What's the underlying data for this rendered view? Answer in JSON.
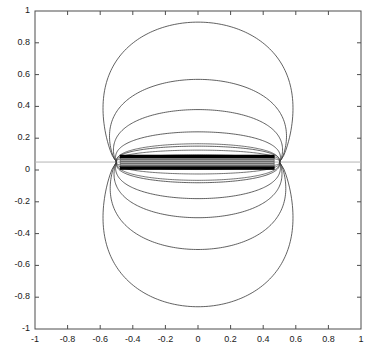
{
  "figure": {
    "title": "",
    "background_color": "#ffffff",
    "frame_color": "#4d4d4d",
    "contour_color": "#3a3a3a",
    "bar_color": "#000000",
    "band_color": "#6e6e6e",
    "guide_line_color": "#b4b4b4"
  },
  "axes": {
    "xlim": [
      -1,
      1
    ],
    "ylim": [
      -1,
      1
    ],
    "grid": false,
    "tick_direction": "in",
    "box": true,
    "xlabel": "",
    "ylabel": "",
    "xticks": [
      -1,
      -0.8,
      -0.6,
      -0.4,
      -0.2,
      0,
      0.2,
      0.4,
      0.6,
      0.8,
      1
    ],
    "yticks": [
      -1,
      -0.8,
      -0.6,
      -0.4,
      -0.2,
      0,
      0.2,
      0.4,
      0.6,
      0.8,
      1
    ],
    "xticklabels": [
      "-1",
      "-0.8",
      "-0.6",
      "-0.4",
      "-0.2",
      "0",
      "0.2",
      "0.4",
      "0.6",
      "0.8",
      "1"
    ],
    "yticklabels": [
      "-1",
      "-0.8",
      "-0.6",
      "-0.4",
      "-0.2",
      "0",
      "0.2",
      "0.4",
      "0.6",
      "0.8",
      "1"
    ]
  },
  "chart_data": {
    "type": "line",
    "title": "",
    "xlabel": "",
    "ylabel": "",
    "xlim": [
      -1,
      1
    ],
    "ylim": [
      -1,
      1
    ],
    "grid": false,
    "legend": "none",
    "source_strip": {
      "x_start": -0.48,
      "x_end": 0.47,
      "y_center": 0.05,
      "upper_bar_y": 0.085,
      "lower_bar_y": 0.012,
      "bar_thickness_y": 0.022,
      "band_fill": "dense horizontal striping between the two bars"
    },
    "guide_line": {
      "y": 0.05,
      "x_from": -1,
      "x_to": 1,
      "color": "#b4b4b4"
    },
    "series": [
      {
        "name": "contour-upper-1",
        "half": "upper",
        "apex_y": 0.93,
        "left_extent_x": -0.71,
        "right_extent_x": 0.72,
        "focus_left_x": -0.5,
        "focus_right_x": 0.5
      },
      {
        "name": "contour-upper-2",
        "half": "upper",
        "apex_y": 0.57,
        "left_extent_x": -0.63,
        "right_extent_x": 0.63,
        "focus_left_x": -0.5,
        "focus_right_x": 0.5
      },
      {
        "name": "contour-upper-3",
        "half": "upper",
        "apex_y": 0.38,
        "left_extent_x": -0.57,
        "right_extent_x": 0.57,
        "focus_left_x": -0.5,
        "focus_right_x": 0.5
      },
      {
        "name": "contour-upper-4",
        "half": "upper",
        "apex_y": 0.24,
        "left_extent_x": -0.53,
        "right_extent_x": 0.53,
        "focus_left_x": -0.5,
        "focus_right_x": 0.5
      },
      {
        "name": "contour-upper-5",
        "half": "upper",
        "apex_y": 0.15,
        "left_extent_x": -0.51,
        "right_extent_x": 0.51,
        "focus_left_x": -0.5,
        "focus_right_x": 0.5
      },
      {
        "name": "contour-lower-1",
        "half": "lower",
        "apex_y": -0.86,
        "left_extent_x": -0.71,
        "right_extent_x": 0.72,
        "focus_left_x": -0.5,
        "focus_right_x": 0.5
      },
      {
        "name": "contour-lower-2",
        "half": "lower",
        "apex_y": -0.5,
        "left_extent_x": -0.62,
        "right_extent_x": 0.62,
        "focus_left_x": -0.5,
        "focus_right_x": 0.5
      },
      {
        "name": "contour-lower-3",
        "half": "lower",
        "apex_y": -0.3,
        "left_extent_x": -0.56,
        "right_extent_x": 0.56,
        "focus_left_x": -0.5,
        "focus_right_x": 0.5
      },
      {
        "name": "contour-lower-4",
        "half": "lower",
        "apex_y": -0.18,
        "left_extent_x": -0.53,
        "right_extent_x": 0.53,
        "focus_left_x": -0.5,
        "focus_right_x": 0.5
      },
      {
        "name": "contour-lower-5",
        "half": "lower",
        "apex_y": -0.08,
        "left_extent_x": -0.51,
        "right_extent_x": 0.51,
        "focus_left_x": -0.5,
        "focus_right_x": 0.5
      }
    ]
  }
}
